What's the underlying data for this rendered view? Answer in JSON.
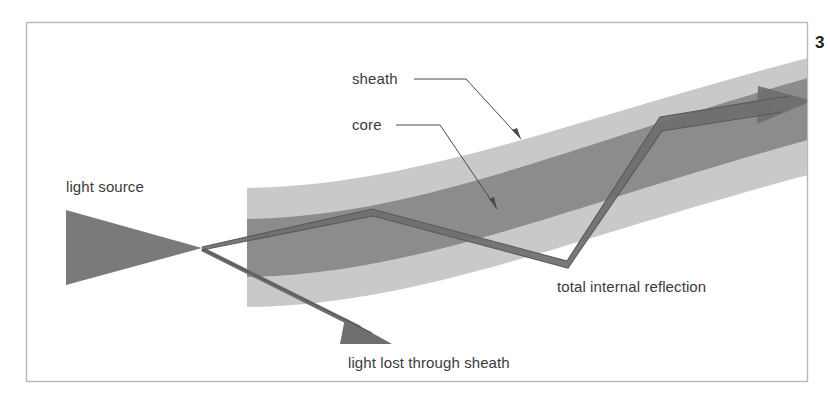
{
  "figure": {
    "number": "3",
    "frame": {
      "x": 26,
      "y": 22,
      "width": 782,
      "height": 360,
      "stroke_color": "#b8b8b8"
    }
  },
  "colors": {
    "sheath": "#c9c9c9",
    "core": "#8c8c8c",
    "beam": "#7a7a7a",
    "ray_stroke": "#606060",
    "label_text": "#3b3b3b",
    "leader_line": "#4a4a4a",
    "background": "#ffffff"
  },
  "labels": {
    "sheath": {
      "text": "sheath",
      "x": 352,
      "y": 84
    },
    "core": {
      "text": "core",
      "x": 352,
      "y": 130
    },
    "light_source": {
      "text": "light source",
      "x": 66,
      "y": 192
    },
    "light_lost": {
      "text": "light lost through sheath",
      "x": 348,
      "y": 368
    },
    "total_internal_reflection": {
      "text": "total internal reflection",
      "x": 557,
      "y": 292
    }
  },
  "leaders": [
    {
      "name": "sheath-leader",
      "points": "414,79 466,79 521,139"
    },
    {
      "name": "core-leader",
      "points": "396,125 440,125 497,209"
    }
  ],
  "geometry": {
    "fiber": {
      "left_x": 247,
      "right_x": 808,
      "sheath_outer_top": "M247,188 C 420,185 570,120 808,58",
      "core_top": "M247,219 C 420,216 570,145 808,78",
      "core_bottom": "M247,277 C 420,274 570,205 808,140",
      "sheath_outer_bottom": "M247,307 C 420,305 570,238 808,175"
    },
    "light_source_triangle": {
      "left_x": 66,
      "top_y": 210,
      "bottom_y": 285,
      "apex_x": 202,
      "apex_y": 248
    },
    "guided_ray": {
      "start": [
        202,
        248
      ],
      "bounce_top": [
        372,
        212
      ],
      "bounce_bottom": [
        567,
        264
      ],
      "bounce_top2": [
        660,
        121
      ],
      "arrow_tip": [
        812,
        101
      ]
    },
    "lost_ray": {
      "start": [
        202,
        248
      ],
      "tip": [
        392,
        344
      ]
    }
  }
}
